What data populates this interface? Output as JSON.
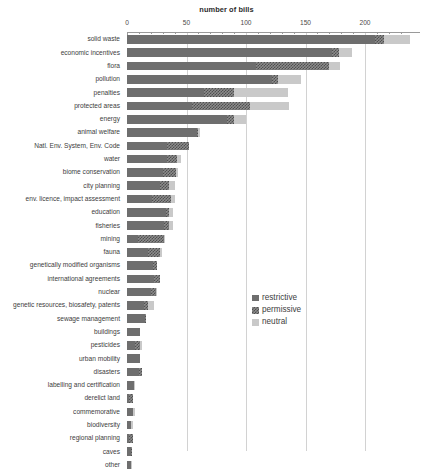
{
  "chart_data": {
    "type": "bar",
    "orientation": "horizontal",
    "stacked": true,
    "title": "number of bills",
    "xlabel": "number of bills",
    "ylabel": "",
    "xlim": [
      0,
      230
    ],
    "xticks": [
      0,
      50,
      100,
      150,
      200
    ],
    "xtick_labels": [
      "0",
      "50",
      "100",
      "150",
      "200"
    ],
    "grid": true,
    "grid_axis": "x",
    "legend_position": "center-right",
    "categories": [
      "solid waste",
      "economic incentives",
      "flora",
      "pollution",
      "penalties",
      "protected areas",
      "energy",
      "animal welfare",
      "Natl. Env. System, Env. Code",
      "water",
      "biome conservation",
      "city planning",
      "env. licence, impact assessment",
      "education",
      "fisheries",
      "mining",
      "fauna",
      "genetically modified organisms",
      "international agreements",
      "nuclear",
      "genetic resources, biosafety, patents",
      "sewage management",
      "buildings",
      "pesticides",
      "urban mobility",
      "disasters",
      "labelling and certification",
      "derelict land",
      "commemorative",
      "biodiversity",
      "regional planning",
      "caves",
      "other"
    ],
    "series": [
      {
        "name": "restrictive",
        "color": "#6e6e6e",
        "values": [
          208,
          172,
          108,
          122,
          65,
          55,
          84,
          59,
          34,
          34,
          30,
          28,
          21,
          33,
          31,
          9,
          18,
          22,
          23,
          20,
          14,
          15,
          11,
          7,
          11,
          10,
          6,
          2,
          5,
          3,
          2,
          3,
          3
        ]
      },
      {
        "name": "permissive",
        "color": "#8c8c8c",
        "values": [
          8,
          6,
          62,
          5,
          25,
          48,
          6,
          1,
          18,
          8,
          11,
          7,
          16,
          2,
          4,
          22,
          10,
          3,
          5,
          4,
          4,
          1,
          0,
          4,
          0,
          3,
          0,
          3,
          0,
          0,
          3,
          1,
          0
        ]
      },
      {
        "name": "neutral",
        "color": "#c9c9c9",
        "values": [
          22,
          11,
          9,
          19,
          45,
          33,
          10,
          1,
          0,
          3,
          2,
          5,
          3,
          4,
          4,
          1,
          1,
          0,
          0,
          1,
          5,
          0,
          0,
          2,
          0,
          0,
          1,
          0,
          2,
          2,
          0,
          0,
          1
        ]
      }
    ]
  },
  "legend": {
    "items": [
      {
        "label": "restrictive",
        "swatch": "restrictive"
      },
      {
        "label": "permissive",
        "swatch": "permissive"
      },
      {
        "label": "neutral",
        "swatch": "neutral"
      }
    ]
  }
}
